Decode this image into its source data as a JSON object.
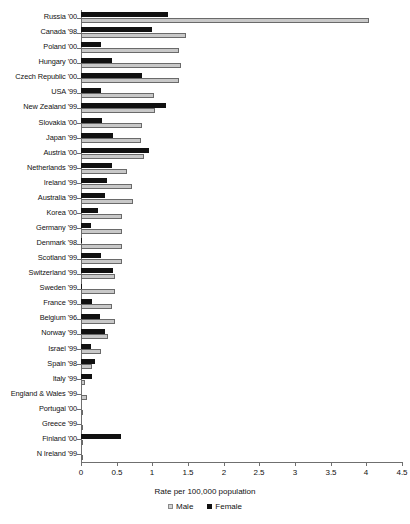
{
  "chart_data": {
    "type": "bar",
    "orientation": "horizontal",
    "title": "",
    "xlabel": "Rate per 100,000 population",
    "ylabel": "",
    "xlim": [
      0,
      4.5
    ],
    "xticks": [
      0,
      0.5,
      1,
      1.5,
      2,
      2.5,
      3,
      3.5,
      4,
      4.5
    ],
    "xtick_labels": [
      "0",
      "0.5",
      "1",
      "1.5",
      "2",
      "2.5",
      "3",
      "3.5",
      "4",
      "4.5"
    ],
    "grid": false,
    "legend_position": "bottom",
    "legend": [
      "Male",
      "Female"
    ],
    "colors": {
      "male": "#c8c8c8",
      "female": "#111111",
      "axis": "#6f6f6f"
    },
    "categories": [
      "Russia '00",
      "Canada '98",
      "Poland '00",
      "Hungary '00",
      "Czech Republic '00",
      "USA '99",
      "New Zealand '99",
      "Slovakia '00",
      "Japan '99",
      "Austria '00",
      "Netherlands '99",
      "Ireland '99",
      "Australia '99",
      "Korea '00",
      "Germany '99",
      "Denmark '98",
      "Scotland '99",
      "Switzerland '99",
      "Sweden '99",
      "France '99",
      "Belgium '96",
      "Norway '99",
      "Israel '99",
      "Spain '98",
      "Italy '99",
      "England & Wales '99",
      "Portugal '00",
      "Greece '99",
      "Finland '00",
      "N Ireland '99"
    ],
    "series": [
      {
        "name": "Male",
        "values": [
          4.04,
          1.47,
          1.37,
          1.4,
          1.37,
          1.02,
          1.04,
          0.85,
          0.84,
          0.89,
          0.64,
          0.72,
          0.73,
          0.58,
          0.58,
          0.57,
          0.57,
          0.48,
          0.47,
          0.44,
          0.48,
          0.38,
          0.28,
          0.15,
          0.06,
          0.08,
          0.0,
          0.0,
          0.0,
          0.0
        ]
      },
      {
        "name": "Female",
        "values": [
          1.22,
          1.0,
          0.28,
          0.44,
          0.85,
          0.28,
          1.19,
          0.29,
          0.45,
          0.95,
          0.43,
          0.37,
          0.34,
          0.24,
          0.14,
          0.02,
          0.28,
          0.45,
          0.01,
          0.16,
          0.27,
          0.34,
          0.14,
          0.19,
          0.15,
          0.0,
          0.0,
          0.0,
          0.56,
          0.0
        ]
      }
    ]
  }
}
